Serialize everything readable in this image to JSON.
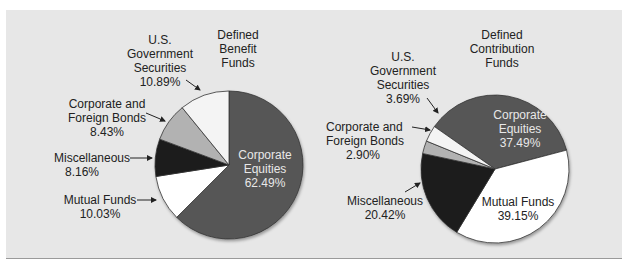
{
  "chart_data": [
    {
      "type": "pie",
      "title": "Defined Benefit Funds",
      "categories": [
        "Corporate Equities",
        "Mutual Funds",
        "Miscellaneous",
        "Corporate and Foreign Bonds",
        "U.S. Government Securities"
      ],
      "values": [
        62.49,
        10.03,
        8.16,
        8.43,
        10.89
      ],
      "colors": [
        "#575757",
        "#ffffff",
        "#1a1a1a",
        "#b2b2b2",
        "#f4f4f4"
      ],
      "start_angle_deg": 0,
      "direction": "clockwise"
    },
    {
      "type": "pie",
      "title": "Defined Contribution Funds",
      "categories": [
        "Corporate Equities",
        "Mutual Funds",
        "Miscellaneous",
        "Corporate and Foreign Bonds",
        "U.S. Government Securities"
      ],
      "values": [
        37.49,
        39.15,
        20.42,
        2.9,
        3.69
      ],
      "colors": [
        "#575757",
        "#ffffff",
        "#1a1a1a",
        "#b2b2b2",
        "#f4f4f4"
      ],
      "start_angle_deg": -55,
      "direction": "clockwise"
    }
  ],
  "left": {
    "title_l1": "Defined",
    "title_l2": "Benefit",
    "title_l3": "Funds",
    "gov_l1": "U.S.",
    "gov_l2": "Government",
    "gov_l3": "Securities",
    "gov_pct": "10.89%",
    "bonds_l1": "Corporate and",
    "bonds_l2": "Foreign Bonds",
    "bonds_pct": "8.43%",
    "misc_l1": "Miscellaneous",
    "misc_pct": "8.16%",
    "mutual_l1": "Mutual Funds",
    "mutual_pct": "10.03%",
    "eq_l1": "Corporate",
    "eq_l2": "Equities",
    "eq_pct": "62.49%"
  },
  "right": {
    "title_l1": "Defined",
    "title_l2": "Contribution",
    "title_l3": "Funds",
    "gov_l1": "U.S.",
    "gov_l2": "Government",
    "gov_l3": "Securities",
    "gov_pct": "3.69%",
    "bonds_l1": "Corporate and",
    "bonds_l2": "Foreign Bonds",
    "bonds_pct": "2.90%",
    "misc_l1": "Miscellaneous",
    "misc_pct": "20.42%",
    "mutual_l1": "Mutual Funds",
    "mutual_pct": "39.15%",
    "eq_l1": "Corporate",
    "eq_l2": "Equities",
    "eq_pct": "37.49%"
  }
}
